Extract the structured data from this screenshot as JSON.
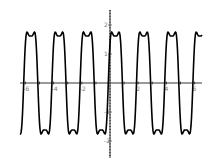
{
  "chart_data": {
    "type": "line",
    "title": "",
    "xlabel": "",
    "ylabel": "",
    "xlim": [
      -6.3,
      6.3
    ],
    "ylim": [
      -2.6,
      2.6
    ],
    "x_ticks": [
      "-6",
      "-4",
      "-2",
      "2",
      "4",
      "6"
    ],
    "y_ticks": [
      "2",
      "1",
      "-1",
      "-2"
    ],
    "grid": false,
    "legend": null,
    "series": [
      {
        "name": "f(x)",
        "description": "periodic wave, period 2, peaks ~2.4 with dip ~1.7 at top, troughs ~-2.4 with bump ~-1.7",
        "color": "#000000"
      }
    ]
  }
}
